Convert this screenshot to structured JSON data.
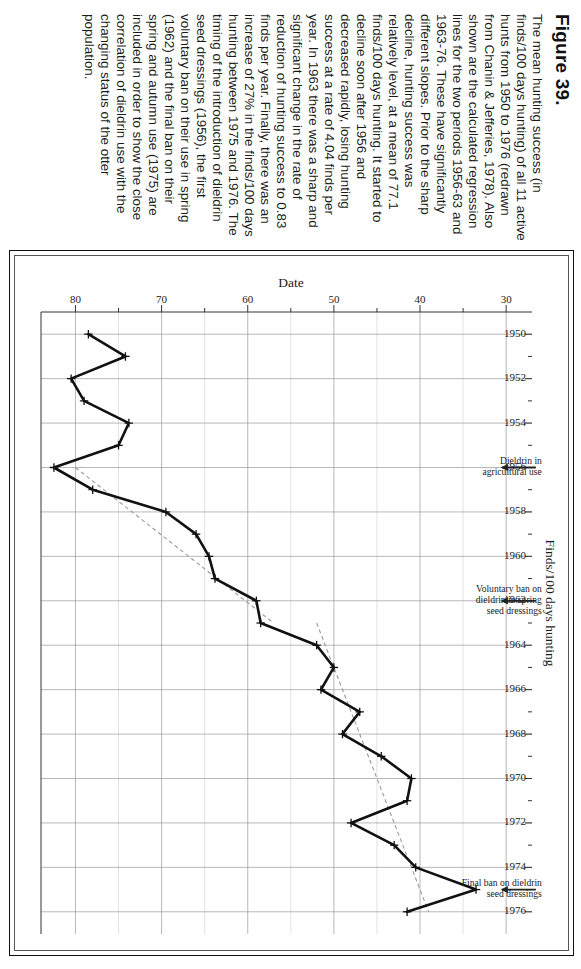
{
  "figure": {
    "title": "Figure 39.",
    "caption": "The mean hunting success (in finds/100 days hunting) of all 11 active hunts from 1950 to 1976 (redrawn from Chanin & Jefferies, 1978). Also shown are the calculated regression lines for the two periods 1956-63 and 1963-76. These have significantly different slopes. Prior to the sharp decline, hunting success was relatively level, at a mean of 77.1 finds/100 days hunting. It started to decline soon after 1956 and decreased rapidly, losing hunting success at a rate of 4.04 finds per year. In 1963 there was a sharp and significant change in the rate of reduction of hunting success to 0.83 finds per year. Finally, there was an increase of 27% in the finds/100 days hunting between 1975 and 1976. The timing of the introduction of dieldrin seed dressings (1956), the first voluntary ban on their use in spring (1962) and the final ban on their spring and autumn use (1975) are included in order to show the close correlation of dieldrin use with the changing status of the otter population."
  },
  "chart_data": {
    "type": "line",
    "title": "",
    "xlabel": "Date",
    "ylabel": "Finds/100 days hunting",
    "xlim": [
      1949,
      1977
    ],
    "ylim": [
      27,
      84
    ],
    "xticks": [
      1950,
      1952,
      1954,
      1956,
      1958,
      1960,
      1962,
      1964,
      1966,
      1968,
      1970,
      1972,
      1974,
      1976
    ],
    "xtick_labels": [
      "1950",
      "1952",
      "1954",
      "1956",
      "1958",
      "1960",
      "1962",
      "1964",
      "1966",
      "1968",
      "1970",
      "1972",
      "1974",
      "1976"
    ],
    "yticks": [
      30,
      40,
      50,
      60,
      70,
      80
    ],
    "ytick_labels": [
      "30",
      "40",
      "50",
      "60",
      "70",
      "80"
    ],
    "yticks_minor": [
      35,
      45,
      55,
      65,
      75
    ],
    "grid": true,
    "legend": "none",
    "series": [
      {
        "name": "Mean hunting success (finds/100 days hunting)",
        "marker": "plus",
        "x": [
          1950,
          1951,
          1952,
          1953,
          1954,
          1955,
          1956,
          1957,
          1958,
          1959,
          1960,
          1961,
          1962,
          1963,
          1964,
          1965,
          1966,
          1967,
          1968,
          1969,
          1970,
          1971,
          1972,
          1973,
          1974,
          1975,
          1976
        ],
        "y": [
          78.5,
          74.2,
          80.5,
          79.0,
          73.8,
          75.0,
          82.5,
          78.0,
          69.5,
          66.0,
          64.5,
          63.8,
          59.0,
          58.5,
          52.0,
          50.0,
          51.5,
          47.0,
          49.0,
          44.5,
          41.0,
          41.5,
          48.0,
          43.0,
          40.5,
          33.5,
          41.5
        ]
      }
    ],
    "regression_lines": [
      {
        "name": "1956-63 regression",
        "style": "dashed",
        "x": [
          1956,
          1963
        ],
        "y": [
          80.0,
          57.0
        ],
        "slope": -4.04
      },
      {
        "name": "1963-76 regression",
        "style": "dashed",
        "x": [
          1963,
          1976
        ],
        "y": [
          52.0,
          39.0
        ],
        "slope": -0.83
      }
    ],
    "annotations": [
      {
        "label": "Dieldrin in agricultural use",
        "x": 1956,
        "y": 30.5,
        "arrow": true
      },
      {
        "label": "Voluntary ban on dieldrin in spring seed dressings",
        "x": 1962,
        "y": 30.5,
        "arrow": true
      },
      {
        "label": "Final ban on dieldrin seed dressings",
        "x": 1975,
        "y": 30.5,
        "arrow": true
      }
    ]
  }
}
